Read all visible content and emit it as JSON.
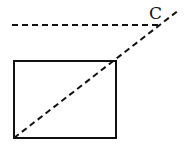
{
  "diagram": {
    "labels": [
      {
        "id": "C",
        "text": "C",
        "x": 149,
        "y": 5
      }
    ],
    "rectangle": {
      "x": 14,
      "y": 61,
      "width": 102,
      "height": 77
    },
    "horizontal_dashed_line": {
      "x1": 12,
      "y1": 25,
      "x2": 161,
      "y2": 25
    },
    "diagonal_dashed_line": {
      "x1": 14,
      "y1": 138,
      "x2": 179,
      "y2": 10
    },
    "stroke_color": "#111111"
  }
}
